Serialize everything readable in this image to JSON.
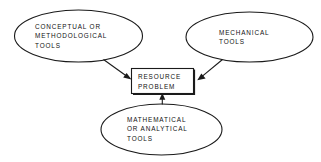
{
  "diagram": {
    "type": "concept-diagram",
    "background_color": "#ffffff",
    "line_color": "#1a1a1a",
    "text_color": "#111111",
    "nodes": [
      {
        "id": "conceptual-tools",
        "shape": "ellipse",
        "label": "CONCEPTUAL OR\nMETHODOLOGICAL\nTOOLS"
      },
      {
        "id": "mechanical-tools",
        "shape": "ellipse",
        "label": "MECHANICAL\nTOOLS"
      },
      {
        "id": "resource-problem",
        "shape": "rectangle",
        "label": "RESOURCE\nPROBLEM"
      },
      {
        "id": "mathematical-tools",
        "shape": "ellipse",
        "label": "MATHEMATICAL\nOR ANALYTICAL\nTOOLS"
      }
    ],
    "edges": [
      {
        "id": "edge-conceptual-to-resource",
        "from": "conceptual-tools",
        "to": "resource-problem",
        "arrow": "single"
      },
      {
        "id": "edge-mechanical-to-resource",
        "from": "mechanical-tools",
        "to": "resource-problem",
        "arrow": "single"
      },
      {
        "id": "edge-mathematical-to-resource",
        "from": "mathematical-tools",
        "to": "resource-problem",
        "arrow": "single"
      }
    ]
  }
}
